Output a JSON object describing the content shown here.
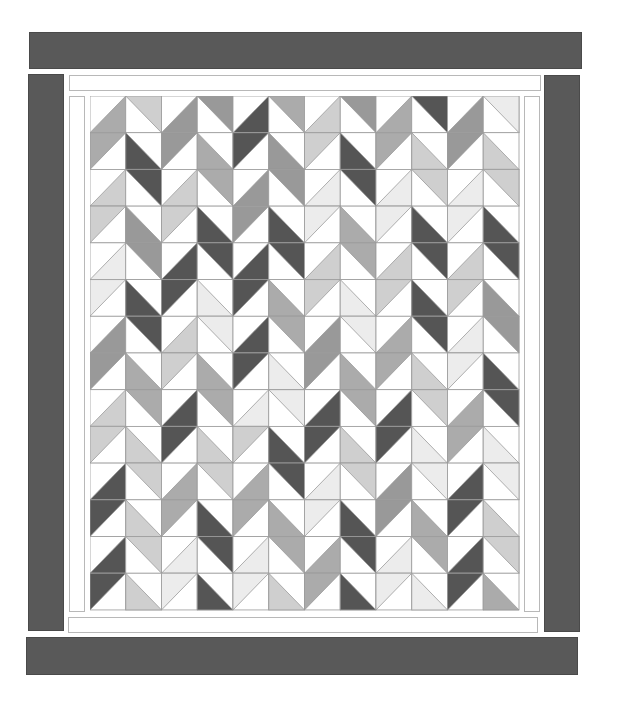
{
  "diagram": {
    "rows": 14,
    "cols": 12,
    "cell_width": 35.75,
    "cell_height": 36.71,
    "grid_origin": [
      90,
      96
    ],
    "line_color": "#9a9a9a",
    "palette": {
      "d": "#555555",
      "m": "#999999",
      "a": "#ababab",
      "l": "#cfcfcf",
      "v": "#ececec",
      "w": "#ffffff"
    },
    "orientation_rule": "even columns use '/' diagonal, odd columns use '\\' diagonal; even rows color lower/right side, odd rows color upper/left side",
    "cells": [
      [
        "a",
        "l",
        "m",
        "m",
        "d",
        "a",
        "l",
        "m",
        "a",
        "d",
        "m",
        "v"
      ],
      [
        "a",
        "d",
        "m",
        "a",
        "d",
        "m",
        "l",
        "d",
        "a",
        "l",
        "m",
        "l"
      ],
      [
        "l",
        "d",
        "l",
        "a",
        "m",
        "m",
        "v",
        "d",
        "v",
        "l",
        "v",
        "l"
      ],
      [
        "l",
        "m",
        "l",
        "d",
        "m",
        "d",
        "v",
        "a",
        "v",
        "d",
        "v",
        "d"
      ],
      [
        "v",
        "m",
        "d",
        "d",
        "d",
        "d",
        "l",
        "a",
        "l",
        "d",
        "l",
        "d"
      ],
      [
        "v",
        "d",
        "d",
        "v",
        "d",
        "a",
        "l",
        "v",
        "l",
        "d",
        "l",
        "m"
      ],
      [
        "m",
        "d",
        "l",
        "v",
        "d",
        "a",
        "m",
        "v",
        "a",
        "d",
        "v",
        "m"
      ],
      [
        "m",
        "a",
        "l",
        "a",
        "d",
        "v",
        "m",
        "a",
        "a",
        "l",
        "v",
        "d"
      ],
      [
        "l",
        "a",
        "d",
        "a",
        "v",
        "v",
        "d",
        "a",
        "d",
        "l",
        "a",
        "d"
      ],
      [
        "l",
        "l",
        "d",
        "l",
        "l",
        "d",
        "d",
        "l",
        "d",
        "v",
        "a",
        "v"
      ],
      [
        "d",
        "l",
        "a",
        "l",
        "a",
        "d",
        "v",
        "l",
        "m",
        "v",
        "d",
        "v"
      ],
      [
        "d",
        "l",
        "a",
        "d",
        "a",
        "a",
        "v",
        "d",
        "m",
        "a",
        "d",
        "l"
      ],
      [
        "d",
        "l",
        "v",
        "d",
        "v",
        "a",
        "a",
        "d",
        "v",
        "a",
        "d",
        "l"
      ],
      [
        "d",
        "l",
        "v",
        "d",
        "v",
        "l",
        "a",
        "d",
        "v",
        "v",
        "d",
        "a"
      ]
    ]
  },
  "borders": {
    "outer_color": "#595959",
    "inner_strip_color": "#ffffff",
    "inner_strip_outline": "#b8b8b8"
  }
}
